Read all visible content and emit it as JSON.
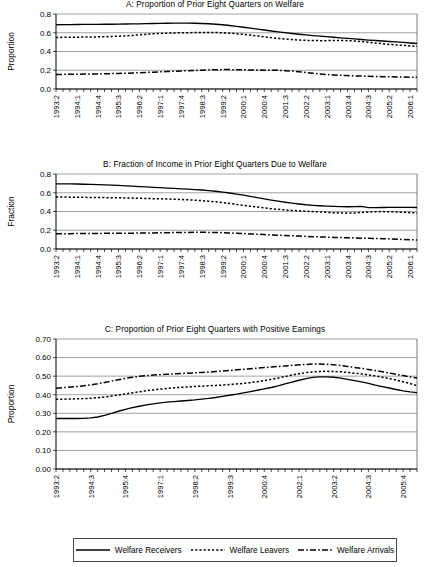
{
  "chart_data": [
    {
      "type": "line",
      "panel": "A",
      "title": "A: Proportion of Prior Eight Quarters on Welfare",
      "xlabel": "",
      "ylabel": "Proportion",
      "ylim": [
        0.0,
        0.8
      ],
      "ytick_labels": [
        "0.0",
        "0.2",
        "0.4",
        "0.6",
        "0.8"
      ],
      "yticks": [
        0.0,
        0.2,
        0.4,
        0.6,
        0.8
      ],
      "grid": true,
      "legend_position": "bottom-shared",
      "n_points": 53,
      "tick_labels": [
        "1993:2",
        "1994:1",
        "1994:4",
        "1995:3",
        "1996:2",
        "1997:1",
        "1997:4",
        "1998:3",
        "1999:2",
        "2000:1",
        "2000:4",
        "2001:3",
        "2002:2",
        "2003:1",
        "2003:4",
        "2004:3",
        "2005:2",
        "2006:1"
      ],
      "tick_label_step": 3,
      "series": [
        {
          "name": "Welfare Receivers",
          "style": "solid",
          "values": [
            0.685,
            0.686,
            0.687,
            0.688,
            0.689,
            0.69,
            0.69,
            0.691,
            0.691,
            0.692,
            0.693,
            0.694,
            0.695,
            0.697,
            0.699,
            0.7,
            0.701,
            0.702,
            0.702,
            0.702,
            0.701,
            0.699,
            0.696,
            0.691,
            0.685,
            0.677,
            0.668,
            0.659,
            0.649,
            0.639,
            0.629,
            0.619,
            0.61,
            0.601,
            0.592,
            0.584,
            0.577,
            0.57,
            0.564,
            0.558,
            0.552,
            0.546,
            0.54,
            0.534,
            0.528,
            0.522,
            0.517,
            0.512,
            0.507,
            0.502,
            0.497,
            0.491,
            0.485
          ]
        },
        {
          "name": "Welfare Leavers",
          "style": "dotted",
          "values": [
            0.55,
            0.551,
            0.552,
            0.553,
            0.554,
            0.555,
            0.556,
            0.558,
            0.56,
            0.563,
            0.567,
            0.572,
            0.578,
            0.584,
            0.589,
            0.593,
            0.596,
            0.598,
            0.6,
            0.601,
            0.602,
            0.603,
            0.603,
            0.602,
            0.6,
            0.596,
            0.59,
            0.583,
            0.575,
            0.566,
            0.557,
            0.548,
            0.54,
            0.533,
            0.527,
            0.522,
            0.519,
            0.517,
            0.516,
            0.516,
            0.517,
            0.518,
            0.516,
            0.512,
            0.506,
            0.499,
            0.491,
            0.483,
            0.476,
            0.47,
            0.465,
            0.46,
            0.455
          ]
        },
        {
          "name": "Welfare Arrivals",
          "style": "dash-dot",
          "values": [
            0.155,
            0.156,
            0.157,
            0.158,
            0.159,
            0.16,
            0.161,
            0.162,
            0.164,
            0.166,
            0.168,
            0.171,
            0.174,
            0.177,
            0.18,
            0.183,
            0.186,
            0.189,
            0.192,
            0.195,
            0.198,
            0.201,
            0.204,
            0.206,
            0.207,
            0.207,
            0.206,
            0.205,
            0.203,
            0.202,
            0.201,
            0.2,
            0.199,
            0.196,
            0.191,
            0.184,
            0.176,
            0.168,
            0.161,
            0.155,
            0.15,
            0.146,
            0.143,
            0.14,
            0.138,
            0.136,
            0.134,
            0.132,
            0.13,
            0.129,
            0.127,
            0.126,
            0.125
          ]
        }
      ]
    },
    {
      "type": "line",
      "panel": "B",
      "title": "B: Fraction of Income in Prior Eight Quarters Due to Welfare",
      "xlabel": "",
      "ylabel": "Fraction",
      "ylim": [
        0.0,
        0.8
      ],
      "ytick_labels": [
        "0.0",
        "0.2",
        "0.4",
        "0.6",
        "0.8"
      ],
      "yticks": [
        0.0,
        0.2,
        0.4,
        0.6,
        0.8
      ],
      "grid": true,
      "legend_position": "bottom-shared",
      "n_points": 53,
      "tick_labels": [
        "1993:2",
        "1994:1",
        "1994:4",
        "1995:3",
        "1996:2",
        "1997:1",
        "1997:4",
        "1998:3",
        "1999:2",
        "2000:1",
        "2000:4",
        "2001:3",
        "2002:2",
        "2003:1",
        "2003:4",
        "2004:3",
        "2005:2",
        "2006:1"
      ],
      "tick_label_step": 3,
      "series": [
        {
          "name": "Welfare Receivers",
          "style": "solid",
          "values": [
            0.695,
            0.695,
            0.694,
            0.693,
            0.691,
            0.689,
            0.687,
            0.684,
            0.681,
            0.678,
            0.674,
            0.67,
            0.666,
            0.662,
            0.658,
            0.654,
            0.65,
            0.646,
            0.642,
            0.638,
            0.634,
            0.629,
            0.623,
            0.616,
            0.607,
            0.597,
            0.586,
            0.574,
            0.561,
            0.548,
            0.535,
            0.522,
            0.51,
            0.499,
            0.489,
            0.48,
            0.472,
            0.466,
            0.461,
            0.457,
            0.454,
            0.452,
            0.451,
            0.452,
            0.455,
            0.442,
            0.442,
            0.443,
            0.444,
            0.444,
            0.444,
            0.444,
            0.443
          ]
        },
        {
          "name": "Welfare Leavers",
          "style": "dotted",
          "values": [
            0.555,
            0.554,
            0.553,
            0.552,
            0.551,
            0.55,
            0.549,
            0.548,
            0.547,
            0.546,
            0.545,
            0.543,
            0.541,
            0.539,
            0.537,
            0.535,
            0.533,
            0.531,
            0.528,
            0.525,
            0.521,
            0.516,
            0.51,
            0.503,
            0.495,
            0.486,
            0.476,
            0.466,
            0.456,
            0.447,
            0.438,
            0.43,
            0.423,
            0.417,
            0.412,
            0.407,
            0.403,
            0.399,
            0.395,
            0.391,
            0.387,
            0.384,
            0.382,
            0.385,
            0.39,
            0.395,
            0.398,
            0.399,
            0.398,
            0.395,
            0.391,
            0.388,
            0.385
          ]
        },
        {
          "name": "Welfare Arrivals",
          "style": "dash-dot",
          "values": [
            0.163,
            0.164,
            0.164,
            0.165,
            0.165,
            0.166,
            0.166,
            0.167,
            0.167,
            0.168,
            0.168,
            0.169,
            0.17,
            0.171,
            0.172,
            0.173,
            0.174,
            0.175,
            0.176,
            0.177,
            0.178,
            0.178,
            0.177,
            0.176,
            0.174,
            0.171,
            0.168,
            0.165,
            0.161,
            0.158,
            0.154,
            0.151,
            0.147,
            0.144,
            0.141,
            0.138,
            0.135,
            0.132,
            0.129,
            0.127,
            0.124,
            0.122,
            0.12,
            0.118,
            0.116,
            0.114,
            0.112,
            0.11,
            0.108,
            0.105,
            0.102,
            0.099,
            0.096
          ]
        }
      ]
    },
    {
      "type": "line",
      "panel": "C",
      "title": "C: Proportion of Prior Eight Quarters with Positive Earnings",
      "xlabel": "",
      "ylabel": "Proportion",
      "ylim": [
        0.0,
        0.7
      ],
      "ytick_labels": [
        "0.00",
        "0.10",
        "0.20",
        "0.30",
        "0.40",
        "0.50",
        "0.60",
        "0.70"
      ],
      "yticks": [
        0.0,
        0.1,
        0.2,
        0.3,
        0.4,
        0.5,
        0.6,
        0.7
      ],
      "grid": true,
      "legend_position": "bottom-shared",
      "n_points": 53,
      "tick_labels": [
        "1993:2",
        "1994:3",
        "1995:4",
        "1997:1",
        "1998:2",
        "1999:3",
        "2000:4",
        "2002:1",
        "2003:2",
        "2004:3",
        "2005:4"
      ],
      "tick_label_step": 5,
      "series": [
        {
          "name": "Welfare Receivers",
          "style": "solid",
          "values": [
            0.272,
            0.272,
            0.272,
            0.272,
            0.273,
            0.275,
            0.28,
            0.289,
            0.3,
            0.311,
            0.321,
            0.33,
            0.338,
            0.345,
            0.351,
            0.356,
            0.36,
            0.363,
            0.366,
            0.369,
            0.372,
            0.376,
            0.38,
            0.385,
            0.391,
            0.397,
            0.403,
            0.41,
            0.417,
            0.424,
            0.431,
            0.439,
            0.448,
            0.458,
            0.468,
            0.478,
            0.487,
            0.493,
            0.496,
            0.496,
            0.494,
            0.489,
            0.483,
            0.476,
            0.469,
            0.461,
            0.452,
            0.444,
            0.436,
            0.428,
            0.421,
            0.415,
            0.411
          ]
        },
        {
          "name": "Welfare Leavers",
          "style": "dotted",
          "values": [
            0.375,
            0.376,
            0.377,
            0.378,
            0.379,
            0.381,
            0.384,
            0.388,
            0.393,
            0.398,
            0.404,
            0.41,
            0.416,
            0.421,
            0.426,
            0.43,
            0.434,
            0.437,
            0.44,
            0.442,
            0.444,
            0.446,
            0.448,
            0.45,
            0.452,
            0.455,
            0.458,
            0.461,
            0.465,
            0.47,
            0.476,
            0.483,
            0.49,
            0.498,
            0.506,
            0.513,
            0.519,
            0.523,
            0.525,
            0.526,
            0.525,
            0.523,
            0.52,
            0.516,
            0.512,
            0.507,
            0.501,
            0.494,
            0.487,
            0.479,
            0.47,
            0.46,
            0.449
          ]
        },
        {
          "name": "Welfare Arrivals",
          "style": "dash-dot",
          "values": [
            0.435,
            0.438,
            0.441,
            0.444,
            0.448,
            0.453,
            0.459,
            0.466,
            0.473,
            0.481,
            0.488,
            0.494,
            0.499,
            0.503,
            0.506,
            0.508,
            0.51,
            0.512,
            0.514,
            0.516,
            0.518,
            0.52,
            0.522,
            0.525,
            0.528,
            0.531,
            0.534,
            0.537,
            0.54,
            0.543,
            0.546,
            0.549,
            0.552,
            0.555,
            0.558,
            0.561,
            0.563,
            0.565,
            0.565,
            0.564,
            0.561,
            0.557,
            0.552,
            0.547,
            0.542,
            0.536,
            0.53,
            0.524,
            0.517,
            0.51,
            0.503,
            0.496,
            0.49
          ]
        }
      ]
    }
  ],
  "legend": {
    "items": [
      {
        "label": "Welfare Receivers",
        "style": "solid"
      },
      {
        "label": "Welfare Leavers",
        "style": "dotted"
      },
      {
        "label": "Welfare Arrivals",
        "style": "dash-dot"
      }
    ]
  }
}
